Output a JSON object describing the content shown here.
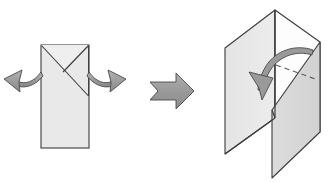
{
  "diagram": {
    "title": "Origami fold step: open flat square-base into 3D form",
    "type": "origami-instruction",
    "background_color": "#ffffff",
    "steps": [
      {
        "id": "step-before",
        "label": "Flat folded rectangle with X creases",
        "shape": "vertical-rectangle"
      },
      {
        "id": "step-after",
        "label": "Opened three-dimensional form",
        "shape": "open-box-panels"
      }
    ],
    "colors": {
      "paper_light": "#e9e9e9",
      "paper_mid": "#dedede",
      "paper_shade": "#d4d4d4",
      "paper_white": "#ffffff",
      "outline": "#3b3b3b",
      "outline_soft": "#555555",
      "arrow_fill": "#9a9a9a",
      "arrow_fill_dark": "#8c8c8c",
      "arrow_outline": "#4a4a4a",
      "dashed_line": "#5a5a5a"
    },
    "left_figure": {
      "name": "flat-rectangle-figure",
      "rect": {
        "x": 41,
        "y": 45,
        "width": 48,
        "height": 103
      },
      "creases": [
        {
          "name": "crease-top-left-diagonal",
          "from": [
            41,
            45
          ],
          "to": [
            89,
            96
          ]
        },
        {
          "name": "crease-top-right-diagonal",
          "from": [
            89,
            45
          ],
          "to": [
            64,
            71
          ]
        },
        {
          "name": "crease-valley-center",
          "from": [
            64,
            71
          ],
          "to": [
            41,
            45
          ]
        }
      ],
      "arrows": [
        {
          "name": "open-left-arrow",
          "direction": "up-left"
        },
        {
          "name": "open-right-arrow",
          "direction": "up-right"
        }
      ]
    },
    "step_arrow": {
      "name": "step-arrow",
      "direction": "right",
      "x": 148,
      "y": 72,
      "width": 46,
      "height": 38
    },
    "right_figure": {
      "name": "three-dimensional-figure",
      "panels": [
        {
          "name": "left-wing-panel",
          "shade": "paper_light"
        },
        {
          "name": "back-left-panel",
          "shade": "paper_mid"
        },
        {
          "name": "back-right-panel",
          "shade": "paper_white"
        },
        {
          "name": "right-wing-panel",
          "shade": "paper_shade"
        }
      ],
      "fold_line": {
        "name": "dashed-fold-line",
        "style": "dashed"
      },
      "arrow": {
        "name": "fold-down-arrow",
        "direction": "down-left"
      }
    }
  }
}
